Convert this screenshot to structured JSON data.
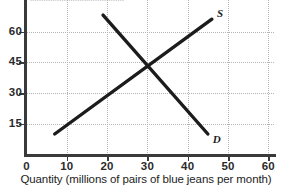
{
  "figure": {
    "clipped_top_text": "..........................................",
    "background_color": "#ffffff",
    "axis_color": "#3a3a3a",
    "grid_color": "#b4b4b4",
    "curve_color": "#1c1c1c"
  },
  "chart_data": {
    "type": "line",
    "title": "",
    "subtitle": "",
    "xlabel": "Quantity (millions of pairs of blue jeans per month)",
    "ylabel": "",
    "xlim": [
      0,
      65
    ],
    "ylim": [
      0,
      70
    ],
    "grid": true,
    "legend_position": "inline-curve-end",
    "x_ticks": [
      0,
      10,
      20,
      30,
      40,
      50,
      60
    ],
    "x_tick_labels": [
      "0",
      "10",
      "20",
      "30",
      "40",
      "50",
      "60"
    ],
    "y_ticks": [
      15,
      30,
      45,
      60
    ],
    "y_tick_labels": [
      "15",
      "30",
      "45",
      "60"
    ],
    "series": [
      {
        "name": "S",
        "label": "S",
        "description": "supply curve",
        "points": [
          [
            7,
            10
          ],
          [
            46,
            66
          ]
        ]
      },
      {
        "name": "D",
        "label": "D",
        "description": "demand curve",
        "points": [
          [
            19,
            68
          ],
          [
            45,
            10
          ]
        ]
      }
    ],
    "annotations": [
      {
        "name": "equilibrium",
        "x": 30,
        "y": 45,
        "label": ""
      }
    ]
  }
}
